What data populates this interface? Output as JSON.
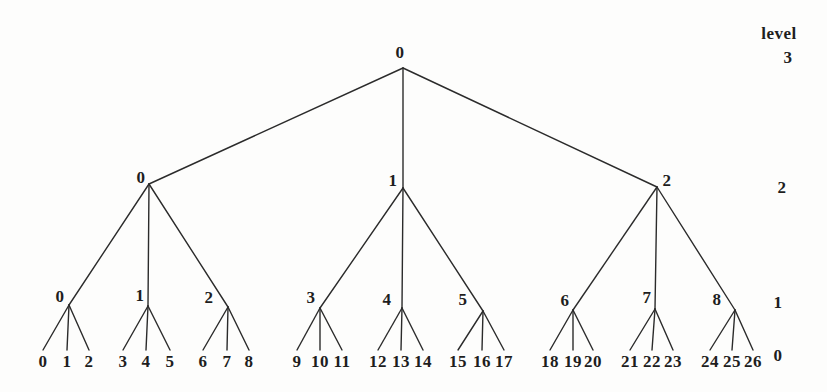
{
  "colors": {
    "background": "#fdfdfc",
    "ink": "#1e1e1e",
    "edge": "#2b2b2b"
  },
  "axis": {
    "title": "level",
    "labels": [
      "3",
      "2",
      "1",
      "0"
    ]
  },
  "tree": {
    "root_label": "0",
    "level2_labels": [
      "0",
      "1",
      "2"
    ],
    "level1_labels": [
      "0",
      "1",
      "2",
      "3",
      "4",
      "5",
      "6",
      "7",
      "8"
    ],
    "leaf_labels": [
      "0",
      "1",
      "2",
      "3",
      "4",
      "5",
      "6",
      "7",
      "8",
      "9",
      "10",
      "11",
      "12",
      "13",
      "14",
      "15",
      "16",
      "17",
      "18",
      "19",
      "20",
      "21",
      "22",
      "23",
      "24",
      "25",
      "26"
    ]
  }
}
